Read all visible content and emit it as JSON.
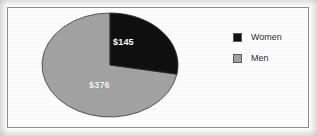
{
  "chart_data": {
    "type": "pie",
    "title": "",
    "categories": [
      "Women",
      "Men"
    ],
    "values": [
      145,
      376
    ],
    "value_labels": [
      "$145",
      "$376"
    ],
    "colors": [
      "#111111",
      "#a2a2a2"
    ],
    "total": 521,
    "start_angle_deg": 0,
    "direction": "clockwise",
    "legend_position": "right",
    "grid": false,
    "xlabel": "",
    "ylabel": ""
  },
  "figure": {
    "background_color": "#ffffff",
    "border_color": "#8d8d8d"
  },
  "slices": [
    {
      "name": "Women",
      "label": "$145",
      "color": "#111111",
      "value": 145
    },
    {
      "name": "Men",
      "label": "$376",
      "color": "#a2a2a2",
      "value": 376
    }
  ],
  "legend": {
    "items": [
      {
        "label": "Women",
        "color": "#111111"
      },
      {
        "label": "Men",
        "color": "#a2a2a2"
      }
    ]
  }
}
